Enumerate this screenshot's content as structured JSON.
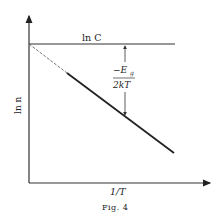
{
  "figure": {
    "caption": "Fig. 4",
    "x_axis_label": "1/T",
    "y_axis_label": "ln n",
    "horizontal_line_label": "ln C",
    "gap_label_numerator": "−E",
    "gap_label_subscript": "g",
    "gap_label_denominator": "2kT"
  },
  "colors": {
    "ink": "#222222",
    "background": "#ffffff"
  }
}
